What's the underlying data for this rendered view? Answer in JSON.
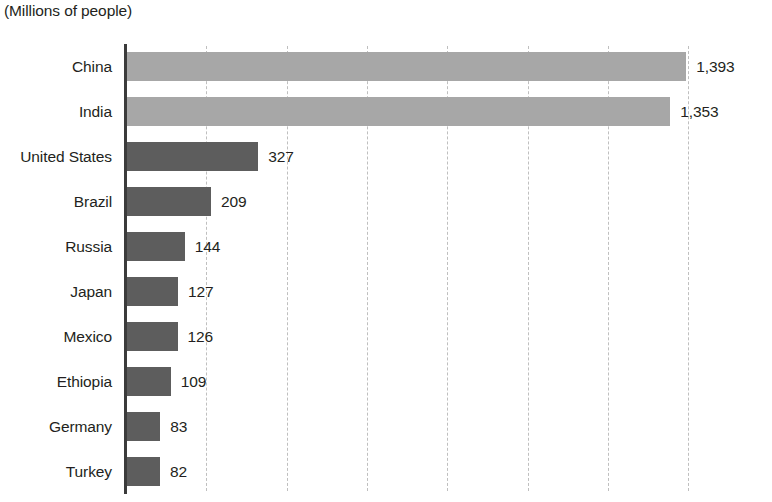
{
  "chart_data": {
    "type": "bar",
    "orientation": "horizontal",
    "title": "",
    "subtitle": "",
    "axis_note": "(Millions of people)",
    "xlabel": "",
    "ylabel": "",
    "xlim": [
      0,
      1600
    ],
    "grid": true,
    "gridline_interval": 200,
    "legend": null,
    "categories": [
      "China",
      "India",
      "United States",
      "Brazil",
      "Russia",
      "Japan",
      "Mexico",
      "Ethiopia",
      "Germany",
      "Turkey"
    ],
    "values": [
      1393,
      1353,
      327,
      209,
      144,
      127,
      126,
      109,
      83,
      82
    ],
    "value_labels": [
      "1,393",
      "1,353",
      "327",
      "209",
      "144",
      "127",
      "126",
      "109",
      "83",
      "82"
    ],
    "bar_colors": [
      "#a7a7a7",
      "#a7a7a7",
      "#5d5d5d",
      "#5d5d5d",
      "#5d5d5d",
      "#5d5d5d",
      "#5d5d5d",
      "#5d5d5d",
      "#5d5d5d",
      "#5d5d5d"
    ]
  },
  "style": {
    "light_bar": "#a7a7a7",
    "dark_bar": "#5d5d5d",
    "axis_line": "#3b3b3b",
    "gridline": "#bfbfbf",
    "text": "#231f20",
    "background": "#ffffff"
  }
}
